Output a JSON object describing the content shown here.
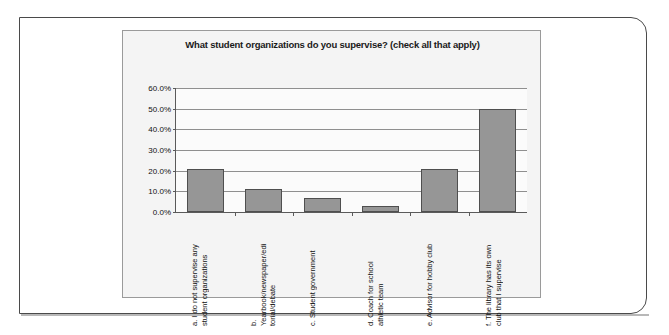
{
  "chart_data": {
    "type": "bar",
    "title": "What student organizations do you supervise? (check all that apply)",
    "xlabel": "",
    "ylabel": "",
    "ylim": [
      0,
      60
    ],
    "ytick_labels": [
      "60.0%",
      "50.0%",
      "40.0%",
      "30.0%",
      "20.0%",
      "10.0%",
      "0.0%"
    ],
    "ytick_values": [
      60,
      50,
      40,
      30,
      20,
      10,
      0
    ],
    "grid": true,
    "legend": "none",
    "bar_color": "#969696",
    "bar_border_color": "#4f4f4f",
    "categories": [
      "a. I do not supervise any\nstudent organizations",
      "b.\nYearbook/newspaper/edi\ntorial/debate",
      "c. Student government",
      "d. Coach for school\nathletic team",
      "e. Advisor for hobby club",
      "f. The library has its own\nclub that I supervise"
    ],
    "values": [
      21,
      11,
      7,
      3,
      21,
      50
    ]
  }
}
